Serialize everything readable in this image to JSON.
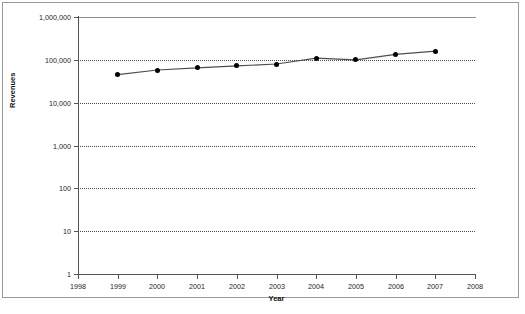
{
  "chart_data": {
    "type": "line",
    "title": "",
    "xlabel": "Year",
    "ylabel": "Revenues",
    "x": [
      1999,
      2000,
      2001,
      2002,
      2003,
      2004,
      2005,
      2006,
      2007
    ],
    "values": [
      45000,
      58000,
      65000,
      72000,
      80000,
      110000,
      100000,
      135000,
      160000
    ],
    "series": [
      {
        "name": "Revenues",
        "x": [
          1999,
          2000,
          2001,
          2002,
          2003,
          2004,
          2005,
          2006,
          2007
        ],
        "values": [
          45000,
          58000,
          65000,
          72000,
          80000,
          110000,
          100000,
          135000,
          160000
        ]
      }
    ],
    "xlim": [
      1998,
      2008
    ],
    "ylim": [
      1,
      1000000
    ],
    "yscale": "log",
    "xscale": "linear",
    "grid": "horizontal-dotted",
    "legend": "none",
    "x_ticks": [
      "1998",
      "1999",
      "2000",
      "2001",
      "2002",
      "2003",
      "2004",
      "2005",
      "2006",
      "2007",
      "2008"
    ],
    "y_ticks": [
      "1",
      "10",
      "100",
      "1,000",
      "10,000",
      "100,000",
      "1,000,000"
    ],
    "y_tick_values": [
      1,
      10,
      100,
      1000,
      10000,
      100000,
      1000000
    ],
    "marker": "filled-diamond",
    "line_color": "#4d4d4d",
    "marker_color": "#000000",
    "grid_color": "#4a4a4a",
    "axis_color": "#555555",
    "background_color": "#ffffff",
    "frame_color": "#9a9a9a"
  }
}
